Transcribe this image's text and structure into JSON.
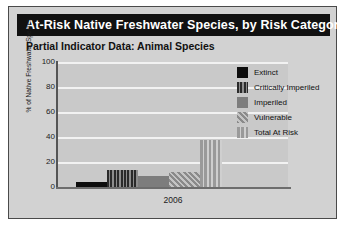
{
  "header": {
    "title": "At-Risk Native Freshwater Species, by Risk Category",
    "subtitle": "Partial Indicator Data: Animal Species"
  },
  "chart_data": {
    "type": "bar",
    "title": "At-Risk Native Freshwater Species, by Risk Category",
    "subtitle": "Partial Indicator Data: Animal Species",
    "xlabel": "",
    "ylabel": "% of Native Freshwater Species",
    "categories": [
      "2006"
    ],
    "ylim": [
      0,
      100
    ],
    "yticks": [
      0,
      20,
      40,
      60,
      80,
      100
    ],
    "ytick_labels": [
      "0",
      "20",
      "40",
      "60",
      "80",
      "100"
    ],
    "grid": true,
    "legend_position": "right",
    "series": [
      {
        "name": "Extinct",
        "values": [
          4
        ],
        "pattern": "solid-black",
        "color": "#0d0d0d"
      },
      {
        "name": "Critically Imperiled",
        "values": [
          14
        ],
        "pattern": "vertical-stripes-dark",
        "color": "#2a2a2a"
      },
      {
        "name": "Imperiled",
        "values": [
          9
        ],
        "pattern": "solid-gray",
        "color": "#7d7d7d"
      },
      {
        "name": "Vulnerable",
        "values": [
          12
        ],
        "pattern": "diagonal-hatch",
        "color": "#8a8a8a"
      },
      {
        "name": "Total At Risk",
        "values": [
          38
        ],
        "pattern": "vertical-stripes-light",
        "color": "#9a9a9a"
      }
    ]
  },
  "axis": {
    "ytick_0": "0",
    "ytick_20": "20",
    "ytick_40": "40",
    "ytick_60": "60",
    "ytick_80": "80",
    "ytick_100": "100",
    "xtick_2006": "2006",
    "ylabel": "% of Native Freshwater Species"
  },
  "legend": {
    "items": [
      {
        "label": "Extinct"
      },
      {
        "label": "Critically Imperiled"
      },
      {
        "label": "Imperiled"
      },
      {
        "label": "Vulnerable"
      },
      {
        "label": "Total At Risk"
      }
    ]
  }
}
